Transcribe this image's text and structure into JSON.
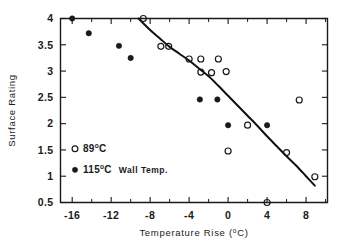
{
  "chart_data": {
    "type": "scatter",
    "title": "",
    "xlabel": "Temperature Rise (°C)",
    "ylabel": "Surface Rating",
    "xlim": [
      -17.2,
      10.2
    ],
    "ylim": [
      0.5,
      4.0
    ],
    "grid": false,
    "legend_position": "inner-lower-left",
    "x_ticks_major": [
      -16,
      -12,
      -8,
      -4,
      0,
      4,
      8
    ],
    "x_tick_labels": [
      "-16",
      "-12",
      "-8",
      "-4",
      "0",
      "4",
      "8"
    ],
    "x_ticks_minor": [
      -14,
      -10,
      -6,
      -2,
      2,
      6,
      10
    ],
    "y_ticks_major": [
      0.5,
      1,
      1.5,
      2,
      2.5,
      3,
      3.5,
      4
    ],
    "y_tick_labels": [
      "0.5",
      "1",
      "1.5",
      "2",
      "2.5",
      "3",
      "3.5",
      "4"
    ],
    "series": [
      {
        "name": "89°C",
        "marker": "open-circle",
        "points": [
          [
            -8.7,
            4.0
          ],
          [
            -6.9,
            3.47
          ],
          [
            -6.1,
            3.47
          ],
          [
            -4.0,
            3.23
          ],
          [
            -2.8,
            3.23
          ],
          [
            -2.8,
            2.98
          ],
          [
            -1.7,
            2.97
          ],
          [
            -1.0,
            3.23
          ],
          [
            -0.2,
            2.99
          ],
          [
            0.0,
            1.48
          ],
          [
            2.0,
            1.97
          ],
          [
            4.0,
            0.5
          ],
          [
            6.0,
            1.45
          ],
          [
            7.3,
            2.45
          ],
          [
            8.9,
            0.99
          ]
        ]
      },
      {
        "name": "115°C",
        "marker": "filled-circle",
        "points": [
          [
            -16.0,
            4.0
          ],
          [
            -14.3,
            3.72
          ],
          [
            -11.2,
            3.48
          ],
          [
            -10.0,
            3.25
          ],
          [
            -2.9,
            2.46
          ],
          [
            -1.1,
            2.46
          ],
          [
            0.0,
            1.97
          ],
          [
            4.0,
            1.97
          ]
        ]
      }
    ],
    "fit_curve": {
      "name": "trend-curve",
      "points": [
        [
          -9.2,
          4.0
        ],
        [
          -8.0,
          3.78
        ],
        [
          -7.0,
          3.62
        ],
        [
          -6.0,
          3.46
        ],
        [
          -5.0,
          3.33
        ],
        [
          -4.0,
          3.2
        ],
        [
          -3.0,
          3.05
        ],
        [
          -2.0,
          2.9
        ],
        [
          -1.0,
          2.72
        ],
        [
          0.0,
          2.53
        ],
        [
          1.0,
          2.34
        ],
        [
          2.0,
          2.15
        ],
        [
          3.0,
          1.96
        ],
        [
          4.0,
          1.76
        ],
        [
          5.0,
          1.57
        ],
        [
          6.0,
          1.38
        ],
        [
          7.0,
          1.2
        ],
        [
          8.0,
          1.0
        ],
        [
          8.9,
          0.82
        ]
      ]
    },
    "legend": [
      {
        "marker": "open-circle",
        "value": "89",
        "degree": "o",
        "unit": "C",
        "suffix": ""
      },
      {
        "marker": "filled-circle",
        "value": "115",
        "degree": "o",
        "unit": "C",
        "suffix": "Wall  Temp."
      }
    ],
    "colors": {
      "axis": "#1a1a1a",
      "marker_open_stroke": "#1a1a1a",
      "marker_filled": "#1a1a1a",
      "curve": "#111111",
      "background": "#ffffff"
    }
  },
  "axes": {
    "x_title_main": "Temperature  Rise  (",
    "x_title_sup": "o",
    "x_title_tail": "C)",
    "y_title": "Surface  Rating"
  }
}
